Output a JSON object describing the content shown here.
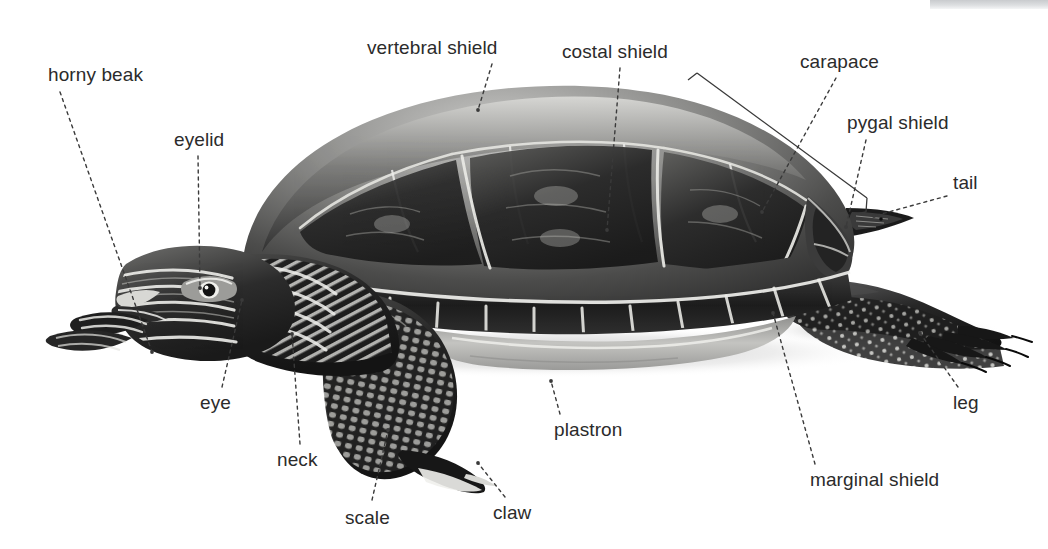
{
  "figure": {
    "background_color": "#ffffff",
    "label_color": "#2b2b2b",
    "leader_color": "#3a3a3a",
    "width": 1048,
    "height": 549
  },
  "labels": [
    {
      "id": "horny-beak",
      "text": "horny beak",
      "x": 48,
      "y": 65,
      "anchor": "start"
    },
    {
      "id": "eyelid",
      "text": "eyelid",
      "x": 174,
      "y": 130,
      "anchor": "start"
    },
    {
      "id": "vertebral-shield",
      "text": "vertebral shield",
      "x": 367,
      "y": 38,
      "anchor": "start"
    },
    {
      "id": "costal-shield",
      "text": "costal shield",
      "x": 562,
      "y": 42,
      "anchor": "start"
    },
    {
      "id": "carapace",
      "text": "carapace",
      "x": 800,
      "y": 52,
      "anchor": "start"
    },
    {
      "id": "pygal-shield",
      "text": "pygal shield",
      "x": 847,
      "y": 113,
      "anchor": "start"
    },
    {
      "id": "tail",
      "text": "tail",
      "x": 953,
      "y": 173,
      "anchor": "start"
    },
    {
      "id": "eye",
      "text": "eye",
      "x": 200,
      "y": 393,
      "anchor": "start"
    },
    {
      "id": "neck",
      "text": "neck",
      "x": 277,
      "y": 450,
      "anchor": "start"
    },
    {
      "id": "scale",
      "text": "scale",
      "x": 345,
      "y": 508,
      "anchor": "start"
    },
    {
      "id": "claw",
      "text": "claw",
      "x": 493,
      "y": 503,
      "anchor": "start"
    },
    {
      "id": "plastron",
      "text": "plastron",
      "x": 554,
      "y": 420,
      "anchor": "start"
    },
    {
      "id": "marginal-shield",
      "text": "marginal shield",
      "x": 810,
      "y": 470,
      "anchor": "start"
    },
    {
      "id": "leg",
      "text": "leg",
      "x": 953,
      "y": 393,
      "anchor": "start"
    }
  ],
  "leaders": [
    {
      "id": "horny-beak-leader",
      "points": "60,92 152,352",
      "style": "dashed"
    },
    {
      "id": "eyelid-leader",
      "points": "198,156 200,288",
      "style": "dashed"
    },
    {
      "id": "vertebral-shield-leader",
      "points": "492,64 478,110",
      "style": "dashed"
    },
    {
      "id": "costal-shield-leader",
      "points": "620,68 607,230",
      "style": "dashed"
    },
    {
      "id": "carapace-leader",
      "points": "836,78 762,212",
      "style": "dashed"
    },
    {
      "id": "pygal-shield-leader",
      "points": "866,140 846,227",
      "style": "dashed"
    },
    {
      "id": "tail-leader",
      "points": "947,196 874,216",
      "style": "dashed"
    },
    {
      "id": "eye-leader",
      "points": "222,387 242,300",
      "style": "dashed"
    },
    {
      "id": "neck-leader",
      "points": "300,444 292,334",
      "style": "dashed"
    },
    {
      "id": "scale-leader",
      "points": "372,500 388,430",
      "style": "dashed"
    },
    {
      "id": "claw-leader",
      "points": "505,497 478,463",
      "style": "dashed"
    },
    {
      "id": "plastron-leader",
      "points": "560,414 551,381",
      "style": "dashed"
    },
    {
      "id": "marginal-shield-leader",
      "points": "815,464 773,313",
      "style": "dashed"
    },
    {
      "id": "leg-leader",
      "points": "958,387 920,333",
      "style": "dashed"
    }
  ],
  "bracket": {
    "id": "carapace-bracket",
    "path": "M 688,80 L 697,73 M 697,73 L 867,198 M 867,198 L 866,212 L 856,214",
    "style": "solid"
  },
  "illustration": {
    "subject": "side view of a painted turtle (Chrysemys) facing left",
    "parts": [
      "carapace",
      "costal shield",
      "vertebral shield",
      "marginal shield",
      "pygal shield",
      "plastron",
      "head",
      "horny beak",
      "eye",
      "eyelid",
      "neck",
      "front leg",
      "hind leg",
      "claw",
      "scale",
      "tail"
    ],
    "palette": {
      "shell_dark": "#2e2e2e",
      "shell_mid": "#6b6b6b",
      "shell_light": "#b9b9b9",
      "seam_light": "#e9e9e6",
      "skin_dark": "#242424",
      "skin_stripe": "#efefec",
      "shadow": "#d9d9d9"
    }
  },
  "corner_artifact": {
    "id": "scan-edge-band",
    "color": "#c9cbce"
  }
}
